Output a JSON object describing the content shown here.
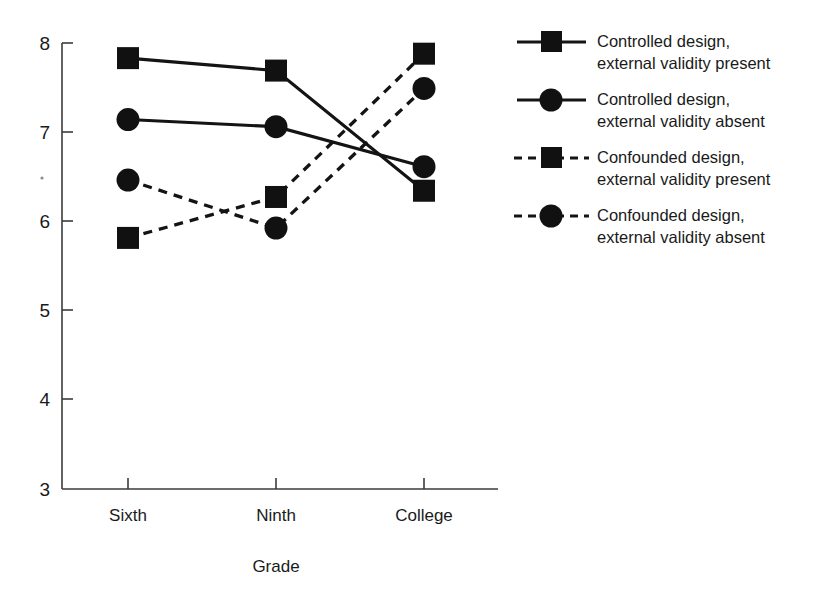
{
  "chart_data": {
    "type": "line",
    "title": "",
    "xlabel": "Grade",
    "ylabel": "",
    "categories": [
      "Sixth",
      "Ninth",
      "College"
    ],
    "ylim": [
      3,
      8
    ],
    "yticks": [
      3,
      4,
      5,
      6,
      7,
      8
    ],
    "ytick_labels": [
      "3",
      "4",
      "5",
      "6",
      "7",
      "8"
    ],
    "grid": false,
    "legend_position": "right",
    "series": [
      {
        "name": "Controlled design, external validity present",
        "values": [
          7.83,
          7.69,
          6.34
        ],
        "line_style": "solid",
        "marker": "square",
        "color": "#111111"
      },
      {
        "name": "Controlled design, external validity absent",
        "values": [
          7.14,
          7.06,
          6.61
        ],
        "line_style": "solid",
        "marker": "circle",
        "color": "#111111"
      },
      {
        "name": "Confounded design, external validity present",
        "values": [
          5.81,
          6.27,
          7.88
        ],
        "line_style": "dashed",
        "marker": "square",
        "color": "#111111"
      },
      {
        "name": "Confounded design, external validity absent",
        "values": [
          6.46,
          5.92,
          7.49
        ],
        "line_style": "dashed",
        "marker": "circle",
        "color": "#111111"
      }
    ]
  },
  "legend": {
    "entries": [
      {
        "line1": "Controlled design,",
        "line2": "external validity present"
      },
      {
        "line1": "Controlled design,",
        "line2": "external validity absent"
      },
      {
        "line1": "Confounded design,",
        "line2": "external validity present"
      },
      {
        "line1": "Confounded design,",
        "line2": "external validity absent"
      }
    ]
  },
  "axes": {
    "x_title": "Grade",
    "x_tick_labels": [
      "Sixth",
      "Ninth",
      "College"
    ],
    "y_tick_labels": [
      "8",
      "7",
      "6",
      "5",
      "4",
      "3"
    ]
  }
}
